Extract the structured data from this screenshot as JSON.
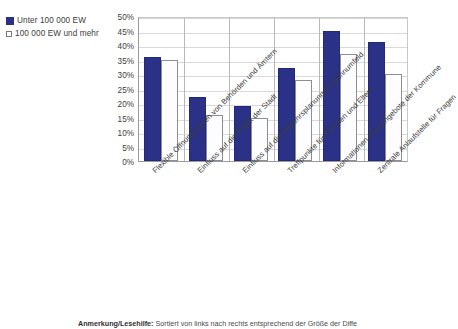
{
  "chart_data": {
    "type": "bar",
    "title": "",
    "subtitle": "",
    "xlabel": "",
    "ylabel": "",
    "ylim": [
      0,
      50
    ],
    "ytick_step": 5,
    "ytick_labels": [
      "50%",
      "45%",
      "40%",
      "35%",
      "30%",
      "25%",
      "20%",
      "15%",
      "10%",
      "5%",
      "0%"
    ],
    "ytick_values": [
      50,
      45,
      40,
      35,
      30,
      25,
      20,
      15,
      10,
      5,
      0
    ],
    "grid": true,
    "legend_position": "top-left",
    "categories": [
      "Flexible Öffnungszeiten von Behörden und Ämtern",
      "Einfluss auf die Politik der Stadt",
      "Einfluss auf die Verkehrsplanung im Wohnumfeld",
      "Treffpunkte für Familien und Eltern",
      "Informationen über Angebote der Kommune",
      "Zentrale Anlaufstelle für Fragen"
    ],
    "series": [
      {
        "name": "Unter 100 000 EW",
        "color": "#2b3186",
        "marker": "filled-square",
        "values": [
          36,
          22,
          19,
          32,
          45,
          41
        ]
      },
      {
        "name": "100 000 EW und mehr",
        "color": "#ffffff",
        "marker": "hollow-square",
        "values": [
          35,
          16,
          15,
          28,
          37,
          30
        ]
      }
    ]
  },
  "legend": {
    "items": [
      {
        "label": "Unter 100 000 EW",
        "swatch": "filled"
      },
      {
        "label": "100 000 EW und mehr",
        "swatch": "hollow"
      }
    ]
  },
  "footnote": {
    "strong": "Anmerkung/Lesehilfe:",
    "text": " Sortiert von links nach rechts entsprechend der Größe der Diffe"
  },
  "colors": {
    "series1": "#2b3186",
    "series2": "#ffffff",
    "series2_border": "#8d8d96",
    "grid": "#d9d9d9",
    "axis": "#9a9a9a",
    "text": "#3d3d3d"
  }
}
